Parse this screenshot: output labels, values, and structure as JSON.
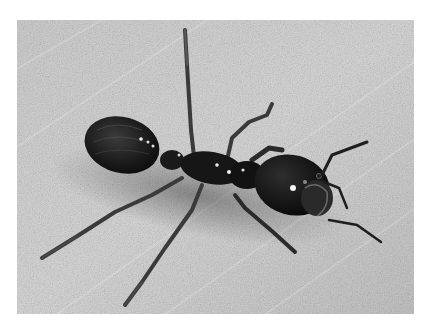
{
  "image": {
    "subject": "black carpenter ant",
    "description": "Grayscale photograph of a large black ant walking diagonally across a light gray textured surface, head toward the right, gaster (abdomen) at upper left, antennae extended forward.",
    "colors": {
      "page_background": "#ffffff",
      "surface_light": "#d4d4d4",
      "surface_mid": "#bdbdbd",
      "ant_body": "#141414",
      "ant_highlight": "#f0f0f0",
      "legs": "#3a3a3a"
    },
    "parts": {
      "gaster": "abdomen",
      "thorax": "mesosoma",
      "head": "head",
      "antennae": "antennae",
      "legs": "legs"
    }
  }
}
